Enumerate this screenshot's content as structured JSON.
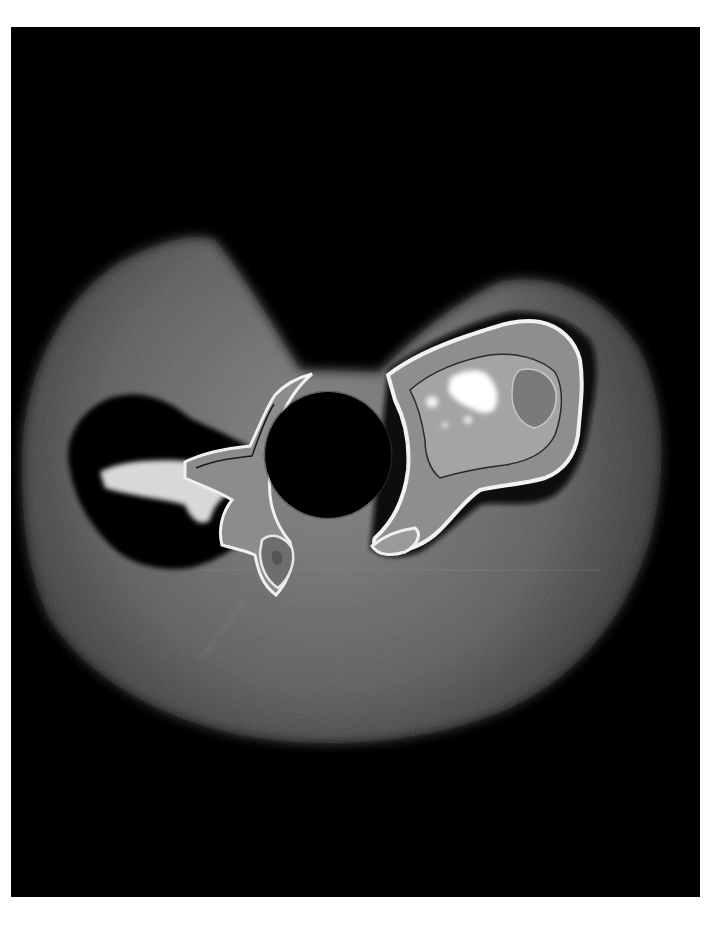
{
  "image": {
    "kind": "coronagraph image",
    "description": "Grayscale coronagraph view of the solar corona with a central black occulting disk and two bright coronal mass ejection structures",
    "background_color": "#000000",
    "page_color": "#ffffff",
    "halo_color": "#6a6a6a",
    "occulter": {
      "cx": 328,
      "cy": 455,
      "r": 63,
      "color": "#000000"
    },
    "features": [
      {
        "name": "right-ejection",
        "position": "upper-right of occulter",
        "brightness": "saturated white core"
      },
      {
        "name": "left-ejection",
        "position": "left of occulter",
        "brightness": "bright streamer with dark surrounding void"
      },
      {
        "name": "outer-halo",
        "position": "surrounding occulter",
        "brightness": "mid grey diffuse"
      }
    ]
  }
}
